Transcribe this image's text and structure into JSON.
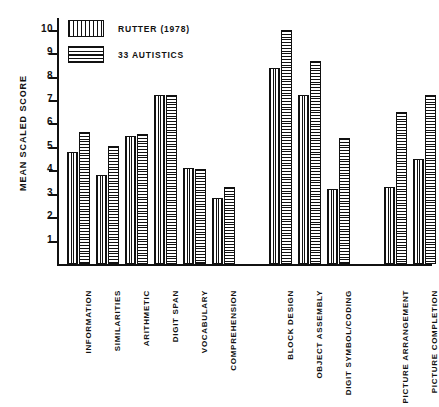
{
  "chart_data": {
    "type": "bar",
    "title": "",
    "xlabel": "",
    "ylabel": "MEAN SCALED SCORE",
    "ylim": [
      0,
      10.5
    ],
    "yticks": [
      1,
      2,
      3,
      4,
      5,
      6,
      7,
      8,
      9,
      10
    ],
    "grid": false,
    "legend_position": "top-left",
    "categories": [
      "INFORMATION",
      "SIMILARITIES",
      "ARITHMETIC",
      "DIGIT SPAN",
      "VOCABULARY",
      "COMPREHENSION",
      "BLOCK DESIGN",
      "OBJECT ASSEMBLY",
      "DIGIT SYMBOL/CODING",
      "PICTURE ARRANGEMENT",
      "PICTURE COMPLETION"
    ],
    "series": [
      {
        "name": "RUTTER (1978)",
        "pattern": "vertical-stripes",
        "values": [
          4.8,
          3.8,
          5.45,
          7.2,
          4.1,
          2.8,
          8.35,
          7.2,
          3.2,
          3.3,
          4.5
        ]
      },
      {
        "name": "33 AUTISTICS",
        "pattern": "horizontal-stripes",
        "values": [
          5.65,
          5.05,
          5.55,
          7.2,
          4.05,
          3.3,
          10.0,
          8.65,
          5.4,
          6.5,
          7.2
        ]
      }
    ]
  },
  "legend": {
    "entries": [
      {
        "label": "RUTTER (1978)"
      },
      {
        "label": "33 AUTISTICS"
      }
    ]
  },
  "colors": {
    "ink": "#111111",
    "background": "#ffffff"
  }
}
